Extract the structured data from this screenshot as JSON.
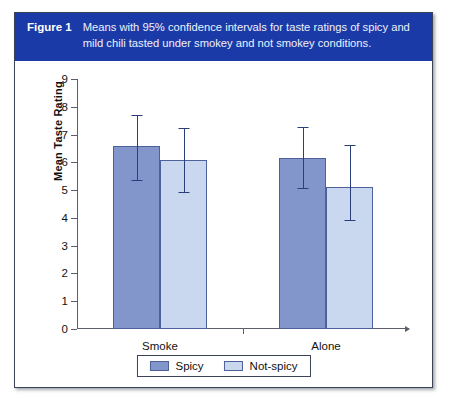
{
  "figure": {
    "number_label": "Figure 1",
    "caption": "Means with 95% confidence intervals for taste ratings of spicy and mild chili tasted under smokey and not smokey conditions.",
    "header_color": "#1a3aa8",
    "panel_background": "#ffffff",
    "border_color": "#3a4456"
  },
  "chart_data": {
    "type": "bar",
    "title": "",
    "xlabel": "",
    "ylabel": "Mean Taste Rating",
    "categories": [
      "Smoke",
      "Alone"
    ],
    "ylim": [
      0,
      9
    ],
    "ytick_labels": [
      "0",
      "1",
      "2",
      "3",
      "4",
      "5",
      "6",
      "7",
      "8",
      "9"
    ],
    "yticks": [
      0,
      1,
      2,
      3,
      4,
      5,
      6,
      7,
      8,
      9
    ],
    "grid": false,
    "legend_position": "bottom-center",
    "error_bars": "95% confidence interval",
    "series": [
      {
        "name": "Spicy",
        "color": "#8296cc",
        "values": [
          6.58,
          6.15
        ],
        "ci_lower": [
          5.38,
          5.07
        ],
        "ci_upper": [
          7.72,
          7.28
        ]
      },
      {
        "name": "Not-spicy",
        "color": "#c9d8ee",
        "values": [
          6.08,
          5.1
        ],
        "ci_lower": [
          4.92,
          3.92
        ],
        "ci_upper": [
          7.22,
          6.62
        ]
      }
    ]
  }
}
